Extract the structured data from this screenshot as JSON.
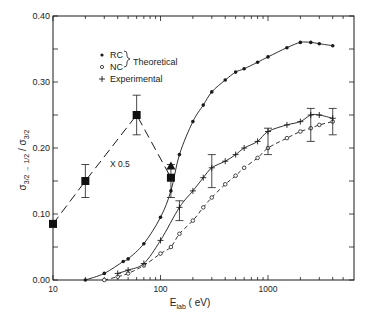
{
  "chart_data": {
    "type": "line",
    "title": "",
    "xlabel": "E_lab (eV)",
    "xlabel_main": "E",
    "xlabel_sub": "lab",
    "xlabel_unit": "( eV)",
    "ylabel": "σ3/2→1/2 / σ3/2",
    "xscale": "log",
    "xlim": [
      10,
      5000
    ],
    "ylim": [
      0.0,
      0.4
    ],
    "x_tick_labels": [
      "10",
      "100",
      "1000"
    ],
    "y_tick_labels": [
      "0.00",
      "0.10",
      "0.20",
      "0.30",
      "0.40"
    ],
    "grid": false,
    "legend": {
      "entries": [
        {
          "marker": "•",
          "label": "RC"
        },
        {
          "marker": "∘",
          "label": "NC"
        },
        {
          "marker": "+",
          "label": "Experimental"
        }
      ],
      "group_label": "Theoretical",
      "position": "upper-left"
    },
    "annotations": [
      {
        "text": "X 0.5",
        "x": 40,
        "y": 0.14
      }
    ],
    "series": [
      {
        "name": "RC (Theoretical)",
        "style": "solid",
        "marker": "dot",
        "x": [
          20,
          30,
          45,
          50,
          70,
          100,
          125,
          150,
          200,
          250,
          300,
          400,
          500,
          600,
          800,
          1000,
          1500,
          2000,
          2500,
          3000,
          4000
        ],
        "y": [
          0.0,
          0.01,
          0.028,
          0.032,
          0.055,
          0.095,
          0.135,
          0.19,
          0.24,
          0.265,
          0.285,
          0.303,
          0.315,
          0.32,
          0.33,
          0.338,
          0.352,
          0.36,
          0.36,
          0.358,
          0.355
        ]
      },
      {
        "name": "NC (Theoretical)",
        "style": "dashed",
        "marker": "open-circle",
        "x": [
          30,
          40,
          50,
          70,
          100,
          125,
          150,
          200,
          250,
          300,
          400,
          500,
          600,
          800,
          1000,
          1500,
          2000,
          2500,
          3000,
          4000
        ],
        "y": [
          0.0,
          0.005,
          0.01,
          0.022,
          0.04,
          0.05,
          0.07,
          0.09,
          0.11,
          0.125,
          0.145,
          0.158,
          0.17,
          0.185,
          0.2,
          0.215,
          0.225,
          0.23,
          0.235,
          0.24
        ]
      },
      {
        "name": "Experimental",
        "style": "solid",
        "marker": "plus",
        "x": [
          40,
          50,
          70,
          100,
          150,
          200,
          250,
          300,
          400,
          500,
          600,
          800,
          1000,
          1500,
          2000,
          2500,
          3000,
          4000
        ],
        "y": [
          0.01,
          0.015,
          0.025,
          0.06,
          0.11,
          0.135,
          0.155,
          0.17,
          0.18,
          0.19,
          0.2,
          0.21,
          0.225,
          0.235,
          0.24,
          0.25,
          0.25,
          0.245
        ],
        "error_bars": [
          {
            "x": 150,
            "y": 0.105,
            "low": 0.09,
            "high": 0.12
          },
          {
            "x": 300,
            "y": 0.165,
            "low": 0.14,
            "high": 0.19
          },
          {
            "x": 1000,
            "y": 0.21,
            "low": 0.19,
            "high": 0.23
          },
          {
            "x": 2500,
            "y": 0.235,
            "low": 0.21,
            "high": 0.26
          },
          {
            "x": 4000,
            "y": 0.245,
            "low": 0.22,
            "high": 0.26
          }
        ]
      },
      {
        "name": "Low-energy data (X 0.5)",
        "style": "long-dash",
        "marker": "filled-square",
        "x": [
          10,
          20,
          60,
          125
        ],
        "y": [
          0.085,
          0.15,
          0.25,
          0.155
        ],
        "error_bars": [
          {
            "x": 20,
            "y": 0.15,
            "low": 0.125,
            "high": 0.175
          },
          {
            "x": 60,
            "y": 0.25,
            "low": 0.22,
            "high": 0.28
          },
          {
            "x": 125,
            "y": 0.155,
            "low": 0.125,
            "high": 0.175
          }
        ]
      },
      {
        "name": "Triangle point",
        "style": "none",
        "marker": "filled-triangle",
        "x": [
          125
        ],
        "y": [
          0.172
        ]
      }
    ]
  }
}
